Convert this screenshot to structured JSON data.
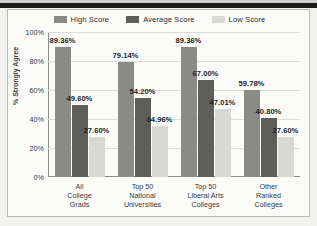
{
  "colors": {
    "high_score": "#8a8a88",
    "average_score": "#5e5e5c",
    "low_score": "#d8d8d6",
    "grid": "#dcdcda",
    "axis": "#8d8d8a",
    "text": "#3a3a3a",
    "frame_background": "#fbfbfa",
    "page_background": "#f2f2f0"
  },
  "chart_data": {
    "type": "bar",
    "title": "",
    "xlabel": "",
    "ylabel": "% Strongly Agree",
    "ylim": [
      0,
      100
    ],
    "yticks": [
      "0%",
      "20%",
      "40%",
      "60%",
      "80%",
      "100%"
    ],
    "ytick_values": [
      0,
      20,
      40,
      60,
      80,
      100
    ],
    "grid": true,
    "legend_position": "top",
    "categories": [
      "All College Grads",
      "Top 50 National Universities",
      "Top 50 Liberal Arts Colleges",
      "Other Ranked Colleges"
    ],
    "category_lines": [
      [
        "All",
        "College",
        "Grads"
      ],
      [
        "Top 50",
        "National",
        "Universities"
      ],
      [
        "Top 50",
        "Liberal Arts",
        "Colleges"
      ],
      [
        "Other",
        "Ranked",
        "Colleges"
      ]
    ],
    "series": [
      {
        "name": "High Score",
        "color": "#8a8a88",
        "values": [
          89.36,
          79.14,
          89.36,
          59.78
        ],
        "labels": [
          "89.36%",
          "79.14%",
          "89.36%",
          "59.78%"
        ]
      },
      {
        "name": "Average Score",
        "color": "#5e5e5c",
        "values": [
          49.6,
          54.2,
          67.0,
          40.8
        ],
        "labels": [
          "49.60%",
          "54.20%",
          "67.00%",
          "40.80%"
        ]
      },
      {
        "name": "Low Score",
        "color": "#d8d8d6",
        "values": [
          27.6,
          34.96,
          47.01,
          27.6
        ],
        "labels": [
          "27.60%",
          "34.96%",
          "47.01%",
          "27.60%"
        ]
      }
    ]
  }
}
